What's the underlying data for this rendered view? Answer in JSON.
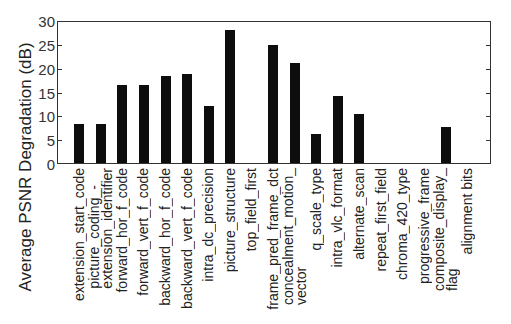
{
  "chart_data": {
    "type": "bar",
    "title": "",
    "xlabel": "",
    "ylabel": "Average PSNR Degradation (dB)",
    "ylim": [
      0,
      30
    ],
    "yticks": [
      0,
      5,
      10,
      15,
      20,
      25,
      30
    ],
    "grid": false,
    "legend": null,
    "categories": [
      "extension_start_code",
      "picture_coding_-\nextension_identifier",
      "forward_hor_f_code",
      "forward_vert_f_code",
      "backward_hor_f_code",
      "backward_vert_f_code",
      "intra_dc_precision",
      "picture_structure",
      "top_field_first",
      "frame_pred_frame_dct",
      "concealment_motion_\nvector",
      "q_scale_type",
      "intra_vlc_format",
      "alternate_scan",
      "repeat_first_field",
      "chroma_420_type",
      "progressive_frame",
      "composite_display_\nflag",
      "alignment bits"
    ],
    "values": [
      8.1,
      8.2,
      16.4,
      16.3,
      18.2,
      18.7,
      12.0,
      28.0,
      0,
      24.7,
      20.9,
      6.1,
      14.0,
      10.3,
      0,
      0,
      0,
      7.5,
      0
    ],
    "bar_color": "#0d0d0d"
  }
}
